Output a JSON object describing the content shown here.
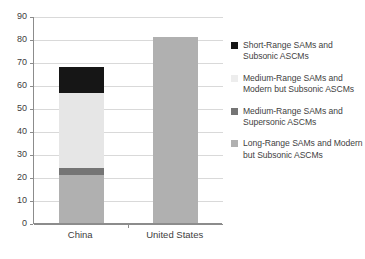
{
  "chart_data": {
    "type": "bar",
    "subtype": "stacked-vertical",
    "title": "",
    "xlabel": "",
    "ylabel": "",
    "categories": [
      "China",
      "United States"
    ],
    "ylim": [
      0,
      90
    ],
    "ytick_interval": 10,
    "ytick_labels": [
      "0",
      "10",
      "20",
      "30",
      "40",
      "50",
      "60",
      "70",
      "80",
      "90"
    ],
    "grid": true,
    "legend_position": "right",
    "series": [
      {
        "name": "Short-Range SAMs and Subsonic ASCMs",
        "color": "#161616",
        "values": [
          11.5,
          0
        ]
      },
      {
        "name": "Medium-Range SAMs and Modern but Subsonic ASCMs",
        "color": "#e6e6e6",
        "values": [
          32.5,
          0
        ]
      },
      {
        "name": "Medium-Range SAMs and Supersonic ASCMs",
        "color": "#757575",
        "values": [
          3,
          0
        ]
      },
      {
        "name": "Long-Range SAMs and Modern but Subsonic ASCMs",
        "color": "#b0b0b0",
        "values": [
          21,
          81
        ]
      }
    ],
    "stack_totals": [
      68,
      81
    ],
    "annotations": []
  },
  "legend": {
    "items": [
      {
        "label": "Short-Range SAMs and Subsonic ASCMs",
        "color": "#161616"
      },
      {
        "label": "Medium-Range SAMs and Modern but Subsonic ASCMs",
        "color": "#ededed"
      },
      {
        "label": "Medium-Range SAMs and Supersonic ASCMs",
        "color": "#757575"
      },
      {
        "label": "Long-Range SAMs and Modern but Subsonic ASCMs",
        "color": "#b0b0b0"
      }
    ]
  },
  "axes": {
    "y_ticks": [
      "90",
      "80",
      "70",
      "60",
      "50",
      "40",
      "30",
      "20",
      "10",
      "0"
    ],
    "x_ticks": [
      "China",
      "United States"
    ]
  }
}
